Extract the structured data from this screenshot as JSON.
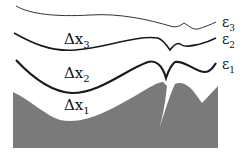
{
  "diagram": {
    "curves": [
      {
        "id": "eps3",
        "label": "ε",
        "subscript": "3"
      },
      {
        "id": "eps2",
        "label": "ε",
        "subscript": "2"
      },
      {
        "id": "eps1",
        "label": "ε",
        "subscript": "1"
      }
    ],
    "regions": [
      {
        "id": "dx3",
        "label": "Δx",
        "subscript": "3"
      },
      {
        "id": "dx2",
        "label": "Δx",
        "subscript": "2"
      },
      {
        "id": "dx1",
        "label": "Δx",
        "subscript": "1"
      }
    ],
    "colors": {
      "fill": "#7a7a7a",
      "line": "#1a1a1a",
      "background": "#ffffff"
    }
  }
}
